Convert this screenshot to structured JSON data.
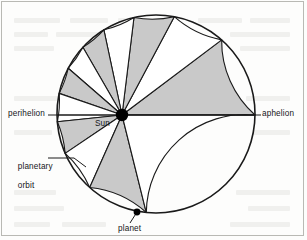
{
  "labels": {
    "perihelion": "perihelion",
    "aphelion": "aphelion",
    "sun": "Sun",
    "planet": "planet",
    "orbit_line1": "planetary",
    "orbit_line2": "orbit"
  },
  "colors": {
    "stroke": "#1a1a1a",
    "sector_shaded": "#c9c9c9",
    "sector_unshaded": "#ffffff",
    "sun_fill": "#000000",
    "planet_fill": "#000000",
    "frame": "#b9b9b4",
    "background": "#fdfdfc",
    "label_text": "#16161a"
  },
  "geometry": {
    "circle": {
      "cx": 156,
      "cy": 114,
      "r": 99
    },
    "sun": {
      "cx": 122,
      "cy": 115,
      "r": 6.2
    },
    "planet": {
      "cx": 137,
      "cy": 212,
      "r": 3.4
    },
    "axis_line": {
      "x1": 57,
      "y1": 115,
      "x2": 255,
      "y2": 115
    },
    "perihelion_leader": {
      "x1": 50,
      "y1": 115,
      "x2": 57,
      "y2": 115
    },
    "aphelion_leader": {
      "x1": 255,
      "y1": 115,
      "x2": 262,
      "y2": 115
    },
    "orbit_leader": {
      "x1": 48,
      "y1": 158,
      "x2": 72,
      "y2": 158,
      "x3": 84,
      "y3": 166
    },
    "planet_leader": {
      "x1": 137,
      "y1": 212,
      "x2": 130,
      "y2": 222
    }
  },
  "chart_data": {
    "type": "pie",
    "legend_position": "none",
    "grid": false,
    "note": "Sector boundary angles measured counter-clockwise from the perihelion direction (pointing left, 180 deg in screen terms). Each sector sweeps an equal area in an equal time; sectors nearest the Sun (perihelion) are angularly wide, those near aphelion are narrow.",
    "categories": [
      "sector-1",
      "sector-2",
      "sector-3",
      "sector-4",
      "sector-5",
      "sector-6",
      "sector-7",
      "sector-8",
      "sector-9",
      "sector-10",
      "sector-11",
      "sector-12"
    ],
    "shading": [
      "shaded",
      "unshaded",
      "shaded",
      "unshaded",
      "shaded",
      "unshaded",
      "shaded",
      "unshaded",
      "shaded",
      "unshaded",
      "shaded",
      "unshaded"
    ],
    "boundary_angles_deg": [
      180,
      143,
      118,
      97,
      78,
      60,
      41,
      19,
      -6,
      -34,
      -66,
      -104,
      -180
    ],
    "values": [
      37,
      25,
      21,
      19,
      18,
      19,
      22,
      25,
      28,
      32,
      38,
      76
    ]
  }
}
